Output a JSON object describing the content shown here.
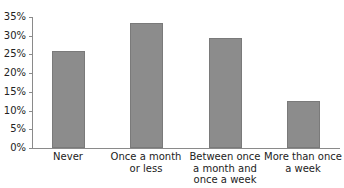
{
  "chart_data": {
    "type": "bar",
    "title": "",
    "xlabel": "",
    "ylabel": "",
    "categories": [
      "Never",
      "Once a month\nor less",
      "Between once\na month and\nonce a week",
      "More than once\na week"
    ],
    "values": [
      26,
      33.5,
      29.5,
      12.5
    ],
    "value_unit": "%",
    "ylim": [
      0,
      35
    ],
    "yticks": [
      "0%",
      "5%",
      "10%",
      "15%",
      "20%",
      "25%",
      "30%",
      "35%"
    ],
    "grid": false,
    "legend": null,
    "bar_color": "#8c8c8c"
  }
}
